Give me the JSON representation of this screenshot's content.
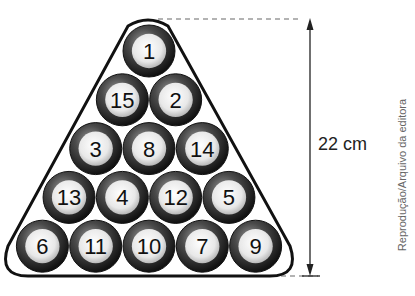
{
  "figure": {
    "type": "billiard-ball-rack-triangle",
    "measurement": {
      "label": "22 cm",
      "orientation": "vertical"
    },
    "credit": "Reprodução/Arquivo da editora",
    "rows": [
      [
        "1"
      ],
      [
        "15",
        "2"
      ],
      [
        "3",
        "8",
        "14"
      ],
      [
        "13",
        "4",
        "12",
        "5"
      ],
      [
        "6",
        "11",
        "10",
        "7",
        "9"
      ]
    ],
    "colors": {
      "ball_ring": "#2a2a2a",
      "ball_face": "#f2f2f2",
      "rack_outline": "#111111",
      "dashed_line": "#999999"
    }
  }
}
